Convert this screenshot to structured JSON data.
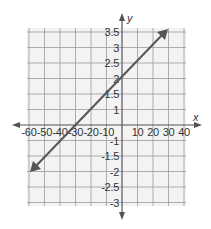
{
  "chart_data": {
    "type": "line",
    "title": "",
    "xlabel": "x",
    "ylabel": "y",
    "x_ticks": [
      -60,
      -50,
      -40,
      -30,
      -20,
      -10,
      10,
      20,
      30,
      40
    ],
    "y_ticks": [
      3.5,
      3,
      2.5,
      2,
      1.5,
      1,
      -1,
      -1.5,
      -2,
      -2.5,
      -3
    ],
    "x_tick_labels": [
      "-60",
      "-50",
      "-40",
      "-30",
      "-20",
      "-10",
      "10",
      "20",
      "30",
      "40"
    ],
    "y_tick_labels": [
      "3.5",
      "3",
      "2.5",
      "2",
      "1.5",
      "1",
      "-1",
      "-1.5",
      "-2",
      "-2.5",
      "-3"
    ],
    "xlim": [
      -60,
      40
    ],
    "ylim": [
      -3,
      3.5
    ],
    "grid": true,
    "legend": null,
    "series": [
      {
        "name": "line",
        "x": [
          -60,
          -30,
          0,
          30
        ],
        "y": [
          -2,
          0,
          2,
          3.5
        ],
        "arrows_both_ends": true
      }
    ],
    "annotations": []
  },
  "colors": {
    "grid_bg": "#f3f3f3",
    "grid_line": "#9a9a9a",
    "axis": "#555555",
    "plot_line": "#555555",
    "text": "#333333"
  }
}
